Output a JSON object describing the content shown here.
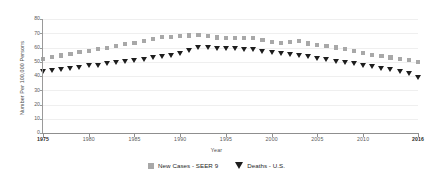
{
  "chart_data": {
    "type": "line",
    "title": "",
    "subtitle": "",
    "xlabel": "Year",
    "ylabel": "Number Per 100,000 Persons",
    "xlim": [
      1975,
      2016
    ],
    "ylim": [
      0,
      80
    ],
    "grid": true,
    "legend_position": "bottom",
    "ytick_labels": [
      "0",
      "10",
      "20",
      "30",
      "40",
      "50",
      "60",
      "70",
      "80"
    ],
    "ytick_values": [
      0,
      10,
      20,
      30,
      40,
      50,
      60,
      70,
      80
    ],
    "xtick_labels": [
      "1975",
      "1980",
      "1985",
      "1990",
      "1995",
      "2000",
      "2005",
      "2010",
      "2016"
    ],
    "xtick_values": [
      1975,
      1980,
      1985,
      1990,
      1995,
      2000,
      2005,
      2010,
      2016
    ],
    "xtick_bold": [
      "1975",
      "2016"
    ],
    "x": [
      1975,
      1976,
      1977,
      1978,
      1979,
      1980,
      1981,
      1982,
      1983,
      1984,
      1985,
      1986,
      1987,
      1988,
      1989,
      1990,
      1991,
      1992,
      1993,
      1994,
      1995,
      1996,
      1997,
      1998,
      1999,
      2000,
      2001,
      2002,
      2003,
      2004,
      2005,
      2006,
      2007,
      2008,
      2009,
      2010,
      2011,
      2012,
      2013,
      2014,
      2015,
      2016
    ],
    "series": [
      {
        "name": "New Cases - SEER 9",
        "marker": "square",
        "color": "#a8a8a8",
        "values": [
          52.0,
          53.2,
          54.4,
          55.6,
          56.6,
          57.6,
          58.8,
          59.8,
          61.0,
          62.2,
          63.2,
          64.4,
          66.2,
          67.4,
          67.6,
          67.8,
          68.4,
          68.8,
          68.0,
          67.0,
          66.6,
          66.6,
          66.8,
          66.6,
          65.0,
          63.8,
          63.2,
          63.6,
          64.4,
          62.8,
          61.6,
          61.0,
          60.0,
          58.8,
          57.4,
          56.2,
          55.0,
          54.0,
          53.0,
          52.0,
          51.0,
          49.8
        ]
      },
      {
        "name": "Deaths - U.S.",
        "marker": "triangle-down",
        "color": "#1d1d1d",
        "values": [
          43.2,
          44.0,
          44.6,
          45.4,
          46.2,
          47.0,
          47.6,
          48.4,
          49.2,
          50.2,
          51.0,
          51.8,
          52.6,
          53.6,
          54.6,
          56.0,
          58.0,
          59.6,
          59.8,
          59.4,
          59.4,
          59.2,
          58.8,
          58.2,
          57.4,
          56.4,
          55.4,
          54.8,
          54.2,
          53.4,
          52.4,
          51.4,
          50.4,
          49.4,
          48.6,
          47.6,
          46.4,
          45.4,
          44.2,
          43.0,
          41.4,
          39.2
        ]
      }
    ]
  },
  "legend": {
    "items": [
      {
        "label": "New Cases - SEER 9",
        "marker": "square",
        "color": "#a8a8a8"
      },
      {
        "label": "Deaths - U.S.",
        "marker": "triangle-down",
        "color": "#1d1d1d"
      }
    ]
  },
  "colors": {
    "new_cases": "#a8a8a8",
    "deaths": "#1d1d1d",
    "axis": "#8f8f8f",
    "gridline": "#efefef",
    "text": "#4a4a4a",
    "background": "#ffffff"
  }
}
